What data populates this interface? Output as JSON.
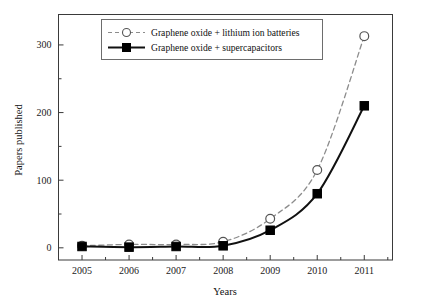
{
  "chart_data": {
    "type": "line",
    "title": "",
    "xlabel": "Years",
    "ylabel": "Papers published",
    "x": [
      2005,
      2006,
      2007,
      2008,
      2009,
      2010,
      2011
    ],
    "categories": [
      "2005",
      "2006",
      "2007",
      "2008",
      "2009",
      "2010",
      "2011"
    ],
    "xlim": [
      2004.5,
      2011.6
    ],
    "ylim": [
      -18,
      345
    ],
    "yticks": [
      0,
      100,
      200,
      300
    ],
    "ytick_labels": [
      "0",
      "100",
      "200",
      "300"
    ],
    "yminor_ticks": [
      50,
      150,
      250
    ],
    "xminor_step": 0.5,
    "grid": false,
    "legend_position": "top-center",
    "series": [
      {
        "name": "Graphene oxide + lithium ion batteries",
        "marker": "open-circle",
        "line_style": "dashed",
        "color": "#8c8c8c",
        "marker_edge_color": "#555555",
        "marker_face_color": "#ffffff",
        "values": [
          3,
          5,
          5,
          9,
          43,
          115,
          313
        ]
      },
      {
        "name": "Graphene oxide + supercapacitors",
        "marker": "filled-square",
        "line_style": "solid",
        "color": "#111111",
        "marker_edge_color": "#000000",
        "marker_face_color": "#000000",
        "values": [
          2,
          1,
          2,
          3,
          26,
          80,
          210
        ]
      }
    ]
  },
  "legend": {
    "entries": [
      {
        "label": "Graphene oxide + lithium ion batteries"
      },
      {
        "label": "Graphene oxide + supercapacitors"
      }
    ]
  },
  "axes": {
    "x_title": "Years",
    "y_title": "Papers published",
    "x_tick_labels": [
      "2005",
      "2006",
      "2007",
      "2008",
      "2009",
      "2010",
      "2011"
    ],
    "y_tick_labels": [
      "0",
      "100",
      "200",
      "300"
    ]
  },
  "colors": {
    "background": "#ffffff",
    "frame": "#3a3a3a",
    "series_a": "#8c8c8c",
    "series_b": "#111111",
    "text": "#111111"
  }
}
